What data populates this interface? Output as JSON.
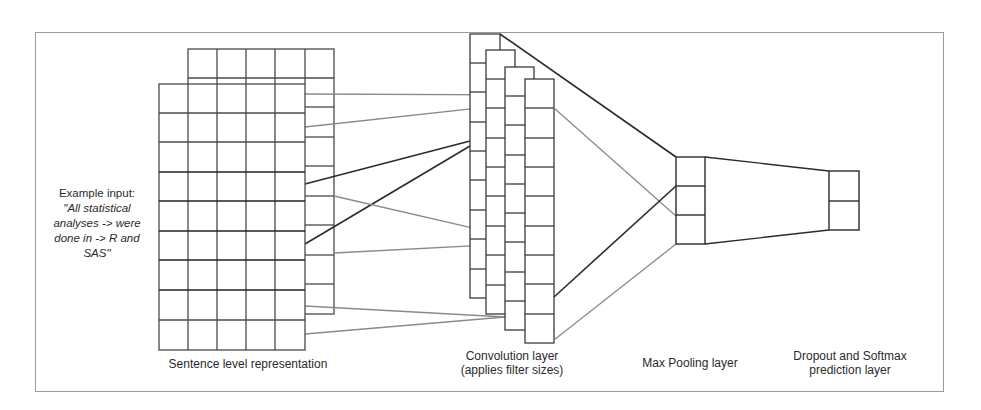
{
  "figure": {
    "input_label": "Example input:",
    "input_sentence": "\"All statistical analyses -> were done in -> R and SAS\"",
    "layers": [
      {
        "id": "sentence",
        "label": "Sentence level representation"
      },
      {
        "id": "conv",
        "label_line1": "Convolution layer",
        "label_line2": "(applies filter sizes)"
      },
      {
        "id": "maxpool",
        "label": "Max Pooling layer"
      },
      {
        "id": "softmax",
        "label_line1": "Dropout and Softmax",
        "label_line2": "prediction layer"
      }
    ],
    "colors": {
      "dark_line": "#2b2b2b",
      "gray_line": "#8a8a8a",
      "frame": "#9a9a9a"
    }
  }
}
